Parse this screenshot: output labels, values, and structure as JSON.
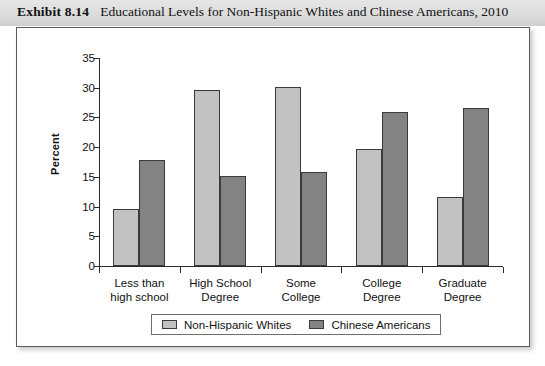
{
  "header": {
    "exhibit_label": "Exhibit 8.14",
    "caption": "Educational Levels for Non-Hispanic Whites and Chinese Americans, 2010"
  },
  "chart_data": {
    "type": "bar",
    "title": "Educational Levels for Non-Hispanic Whites and Chinese Americans, 2010",
    "xlabel": "",
    "ylabel": "Percent",
    "ylim": [
      0,
      35
    ],
    "ytick_step": 5,
    "yticks": [
      0,
      5,
      10,
      15,
      20,
      25,
      30,
      35
    ],
    "ytick_labels": [
      "0",
      "5",
      "10",
      "15",
      "20",
      "25",
      "30",
      "35"
    ],
    "grid": false,
    "legend_position": "bottom",
    "categories": [
      "Less than high school",
      "High School Degree",
      "Some College",
      "College Degree",
      "Graduate Degree"
    ],
    "category_lines": [
      [
        "Less than",
        "high school"
      ],
      [
        "High School",
        "Degree"
      ],
      [
        "Some",
        "College"
      ],
      [
        "College",
        "Degree"
      ],
      [
        "Graduate",
        "Degree"
      ]
    ],
    "series": [
      {
        "name": "Non-Hispanic Whites",
        "color": "#c2c2c2",
        "values": [
          9.6,
          29.6,
          30.2,
          19.7,
          11.6
        ]
      },
      {
        "name": "Chinese Americans",
        "color": "#838383",
        "values": [
          17.8,
          15.1,
          15.8,
          25.9,
          26.6
        ]
      }
    ]
  }
}
